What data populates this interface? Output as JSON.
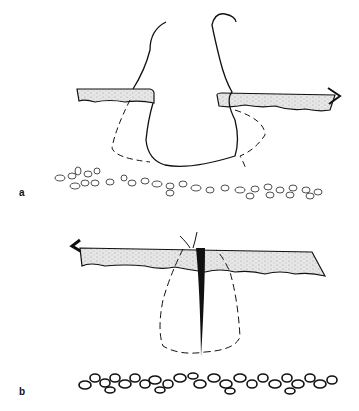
{
  "panels": [
    {
      "label": "a",
      "description": "Suture loop passing through skin edges of an open wound above subcutaneous fat layer; arrow indicating direction"
    },
    {
      "label": "b",
      "description": "Wound edges approximated with tied suture; dashed loop shows suture path through tissue"
    }
  ],
  "caption_fragment": "",
  "colors": {
    "ink": "#111111",
    "skin_fill": "#d8d8d8",
    "background": "#ffffff"
  }
}
